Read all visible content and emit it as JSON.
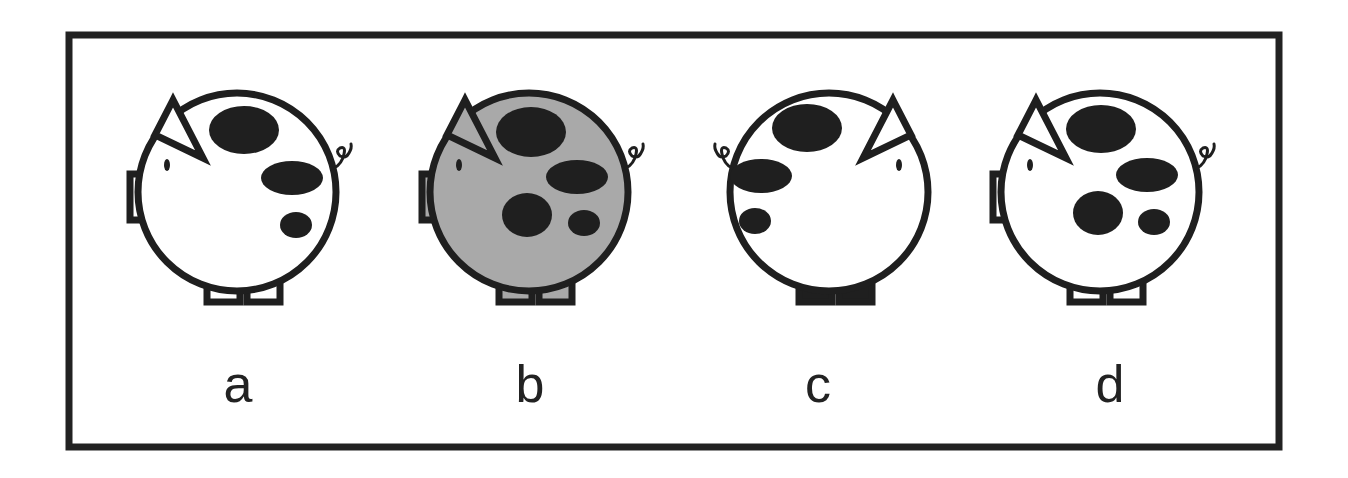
{
  "figure": {
    "frame": {
      "x": 69,
      "y": 35,
      "width": 1210,
      "height": 412,
      "stroke": "#222222",
      "stroke_width": 7
    },
    "colors": {
      "ink": "#1f1f1f",
      "white": "#ffffff",
      "gray": "#a9a9a9"
    },
    "pigs": [
      {
        "id": "a",
        "label": "a",
        "cx": 237,
        "cy": 192,
        "r": 99,
        "facing": "left",
        "body_fill": "#ffffff",
        "ear_fill": "#ffffff",
        "legs_fill": "#ffffff",
        "spots": [
          {
            "cx": 244,
            "cy": 130,
            "rx": 35,
            "ry": 24
          },
          {
            "cx": 292,
            "cy": 178,
            "rx": 31,
            "ry": 17
          },
          {
            "cx": 296,
            "cy": 225,
            "rx": 16,
            "ry": 13
          }
        ],
        "label_x": 238,
        "label_y": 402
      },
      {
        "id": "b",
        "label": "b",
        "cx": 529,
        "cy": 192,
        "r": 99,
        "facing": "left",
        "body_fill": "#a9a9a9",
        "ear_fill": "#a9a9a9",
        "legs_fill": "#a9a9a9",
        "spots": [
          {
            "cx": 531,
            "cy": 132,
            "rx": 35,
            "ry": 25
          },
          {
            "cx": 577,
            "cy": 177,
            "rx": 31,
            "ry": 17
          },
          {
            "cx": 527,
            "cy": 215,
            "rx": 25,
            "ry": 22
          },
          {
            "cx": 584,
            "cy": 223,
            "rx": 16,
            "ry": 13
          }
        ],
        "label_x": 530,
        "label_y": 402
      },
      {
        "id": "c",
        "label": "c",
        "cx": 829,
        "cy": 192,
        "r": 99,
        "facing": "right",
        "body_fill": "#ffffff",
        "ear_fill": "#a9a9a9",
        "legs_fill": "#1f1f1f",
        "spots": [
          {
            "cx": 807,
            "cy": 128,
            "rx": 35,
            "ry": 24
          },
          {
            "cx": 761,
            "cy": 176,
            "rx": 31,
            "ry": 17
          },
          {
            "cx": 755,
            "cy": 221,
            "rx": 16,
            "ry": 13
          }
        ],
        "label_x": 818,
        "label_y": 402
      },
      {
        "id": "d",
        "label": "d",
        "cx": 1100,
        "cy": 192,
        "r": 99,
        "facing": "left",
        "body_fill": "#ffffff",
        "ear_fill": "#ffffff",
        "legs_fill": "#ffffff",
        "spots": [
          {
            "cx": 1101,
            "cy": 129,
            "rx": 35,
            "ry": 24
          },
          {
            "cx": 1147,
            "cy": 175,
            "rx": 31,
            "ry": 17
          },
          {
            "cx": 1098,
            "cy": 213,
            "rx": 25,
            "ry": 22
          },
          {
            "cx": 1154,
            "cy": 222,
            "rx": 16,
            "ry": 13
          }
        ],
        "label_x": 1110,
        "label_y": 402
      }
    ]
  }
}
